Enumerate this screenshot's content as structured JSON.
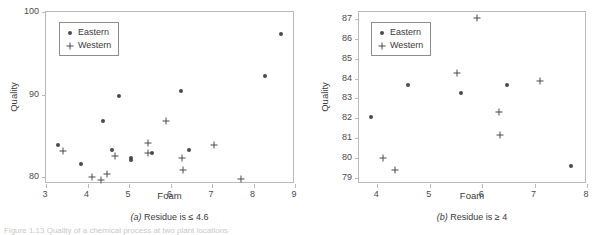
{
  "figure": {
    "caption_partial": "Figure 1.13   Quality of a chemical process at two plant locations"
  },
  "chart_data": [
    {
      "type": "scatter",
      "panel_id": "a",
      "title": "",
      "subcaption": "(a) Residue is ≤ 4.6",
      "subcaption_prefix": "(a)",
      "subcaption_text": " Residue is ≤ 4.6",
      "xlabel": "Foam",
      "ylabel": "Quality",
      "xlim": [
        3,
        9
      ],
      "ylim": [
        79.2,
        100
      ],
      "xticks": [
        3,
        4,
        5,
        6,
        7,
        8,
        9
      ],
      "xtick_labels": [
        "3",
        "4",
        "5",
        "6",
        "7",
        "8",
        "9"
      ],
      "yticks": [
        80,
        90,
        100
      ],
      "ytick_labels": [
        "80",
        "90",
        "100"
      ],
      "grid": false,
      "legend_position": "upper-left",
      "series": [
        {
          "name": "Eastern",
          "marker": "filled-circle",
          "color": "#4a4a52",
          "points": [
            [
              3.28,
              83.9
            ],
            [
              3.85,
              81.6
            ],
            [
              4.38,
              86.8
            ],
            [
              4.58,
              83.3
            ],
            [
              4.76,
              89.9
            ],
            [
              5.06,
              82.1
            ],
            [
              5.06,
              82.4
            ],
            [
              5.56,
              82.9
            ],
            [
              6.25,
              90.5
            ],
            [
              6.45,
              83.3
            ],
            [
              8.28,
              92.3
            ],
            [
              8.66,
              97.3
            ]
          ]
        },
        {
          "name": "Western",
          "marker": "plus",
          "color": "#4a4a52",
          "points": [
            [
              3.4,
              83.2
            ],
            [
              4.1,
              80.0
            ],
            [
              4.33,
              79.7
            ],
            [
              4.47,
              80.4
            ],
            [
              4.67,
              82.6
            ],
            [
              5.45,
              84.1
            ],
            [
              5.45,
              83.0
            ],
            [
              5.9,
              86.8
            ],
            [
              6.27,
              82.3
            ],
            [
              6.3,
              80.9
            ],
            [
              7.06,
              83.9
            ],
            [
              7.7,
              79.8
            ]
          ]
        }
      ]
    },
    {
      "type": "scatter",
      "panel_id": "b",
      "title": "",
      "subcaption": "(b) Residue is ≥ 4",
      "subcaption_prefix": "(b)",
      "subcaption_text": " Residue is ≥ 4",
      "xlabel": "Foam",
      "ylabel": "Quality",
      "xlim": [
        3.65,
        8
      ],
      "ylim": [
        78.7,
        87.35
      ],
      "xticks": [
        4,
        5,
        6,
        7,
        8
      ],
      "xtick_labels": [
        "4",
        "5",
        "6",
        "7",
        "8"
      ],
      "yticks": [
        79,
        80,
        81,
        82,
        83,
        84,
        85,
        86,
        87
      ],
      "ytick_labels": [
        "79",
        "80",
        "81",
        "82",
        "83",
        "84",
        "85",
        "86",
        "87"
      ],
      "grid": false,
      "legend_position": "upper-left",
      "series": [
        {
          "name": "Eastern",
          "marker": "filled-circle",
          "color": "#4a4a52",
          "points": [
            [
              3.88,
              82.05
            ],
            [
              4.59,
              83.67
            ],
            [
              5.6,
              83.26
            ],
            [
              6.47,
              83.7
            ],
            [
              7.69,
              79.62
            ]
          ]
        },
        {
          "name": "Western",
          "marker": "plus",
          "color": "#4a4a52",
          "points": [
            [
              4.11,
              80.0
            ],
            [
              4.33,
              79.4
            ],
            [
              5.52,
              84.27
            ],
            [
              5.9,
              87.07
            ],
            [
              6.32,
              82.32
            ],
            [
              6.34,
              81.14
            ],
            [
              7.1,
              83.9
            ]
          ]
        }
      ]
    }
  ]
}
